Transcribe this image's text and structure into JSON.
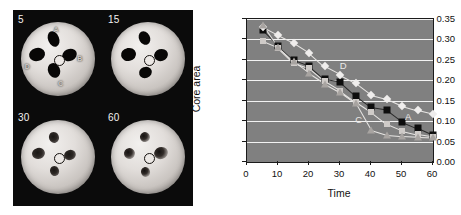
{
  "figure": {
    "montage": {
      "panels": [
        {
          "label": "5",
          "timepoint": 5,
          "site_labels": [
            {
              "text": "A",
              "x": 44,
              "y": 5
            },
            {
              "text": "B",
              "x": 76,
              "y": 44
            },
            {
              "text": "C",
              "x": 50,
              "y": 78
            },
            {
              "text": "D",
              "x": 5,
              "y": 55
            }
          ],
          "lesions": [
            {
              "x": 44,
              "y": 22,
              "w": 15,
              "h": 21,
              "rot": -22,
              "style": "solid"
            },
            {
              "x": 66,
              "y": 44,
              "w": 20,
              "h": 16,
              "rot": -24,
              "style": "solid"
            },
            {
              "x": 44,
              "y": 66,
              "w": 16,
              "h": 20,
              "rot": -22,
              "style": "solid"
            },
            {
              "x": 22,
              "y": 44,
              "w": 22,
              "h": 17,
              "rot": -16,
              "style": "solid"
            }
          ]
        },
        {
          "label": "15",
          "timepoint": 15,
          "site_labels": [],
          "lesions": [
            {
              "x": 46,
              "y": 22,
              "w": 15,
              "h": 19,
              "rot": -28,
              "style": "solid"
            },
            {
              "x": 67,
              "y": 45,
              "w": 19,
              "h": 16,
              "rot": -18,
              "style": "solid"
            },
            {
              "x": 46,
              "y": 68,
              "w": 17,
              "h": 15,
              "rot": -20,
              "style": "solid"
            },
            {
              "x": 23,
              "y": 44,
              "w": 20,
              "h": 17,
              "rot": -12,
              "style": "solid"
            }
          ]
        },
        {
          "label": "30",
          "timepoint": 30,
          "site_labels": [],
          "lesions": [
            {
              "x": 45,
              "y": 24,
              "w": 13,
              "h": 15,
              "rot": -20,
              "style": "soft"
            },
            {
              "x": 66,
              "y": 47,
              "w": 16,
              "h": 14,
              "rot": -20,
              "style": "soft"
            },
            {
              "x": 45,
              "y": 68,
              "w": 12,
              "h": 13,
              "rot": -18,
              "style": "soft"
            },
            {
              "x": 24,
              "y": 45,
              "w": 17,
              "h": 15,
              "rot": -14,
              "style": "soft"
            }
          ]
        },
        {
          "label": "60",
          "timepoint": 60,
          "site_labels": [],
          "lesions": [
            {
              "x": 46,
              "y": 23,
              "w": 14,
              "h": 14,
              "rot": -16,
              "style": "frag"
            },
            {
              "x": 68,
              "y": 45,
              "w": 19,
              "h": 16,
              "rot": -18,
              "style": "frag"
            },
            {
              "x": 46,
              "y": 70,
              "w": 12,
              "h": 13,
              "rot": -14,
              "style": "frag"
            },
            {
              "x": 25,
              "y": 46,
              "w": 15,
              "h": 15,
              "rot": -12,
              "style": "frag"
            }
          ]
        }
      ]
    }
  },
  "chart_data": {
    "type": "line",
    "title": "",
    "xlabel": "Time",
    "ylabel": "Core area",
    "xlim": [
      0,
      60
    ],
    "ylim": [
      0.0,
      0.35
    ],
    "xticks": [
      0,
      10,
      20,
      30,
      40,
      50,
      60
    ],
    "yticks": [
      "0.00",
      "0.05",
      "0.10",
      "0.15",
      "0.20",
      "0.25",
      "0.30",
      "0.35"
    ],
    "grid": "horizontal-white",
    "plot_background": "#808080",
    "legend": "none-inline-annotations",
    "annotations": [
      {
        "text": "D",
        "x": 31,
        "y": 0.238
      },
      {
        "text": "C",
        "x": 36,
        "y": 0.105
      },
      {
        "text": "A",
        "x": 52,
        "y": 0.112
      }
    ],
    "x": [
      5,
      10,
      15,
      20,
      25,
      30,
      35,
      40,
      45,
      50,
      55,
      60
    ],
    "series": [
      {
        "name": "A",
        "marker": "square-dark",
        "color": "#0d0d0d",
        "values": [
          0.322,
          0.284,
          0.249,
          0.235,
          0.202,
          0.196,
          0.162,
          0.134,
          0.128,
          0.099,
          0.083,
          0.066
        ]
      },
      {
        "name": "D",
        "marker": "diamond-light",
        "color": "#efedec",
        "values": [
          0.331,
          0.311,
          0.292,
          0.268,
          0.234,
          0.214,
          0.194,
          0.165,
          0.155,
          0.138,
          0.127,
          0.118
        ]
      },
      {
        "name": "C",
        "marker": "square-light",
        "color": "#cfcbc8",
        "values": [
          0.296,
          0.28,
          0.243,
          0.23,
          0.198,
          0.175,
          0.148,
          0.123,
          0.093,
          0.077,
          0.068,
          0.062
        ]
      },
      {
        "name": "B",
        "marker": "triangle-gray",
        "color": "#a8a4a1",
        "values": [
          0.336,
          0.281,
          0.246,
          0.217,
          0.192,
          0.171,
          0.144,
          0.078,
          0.066,
          0.063,
          0.061,
          0.06
        ]
      }
    ]
  }
}
